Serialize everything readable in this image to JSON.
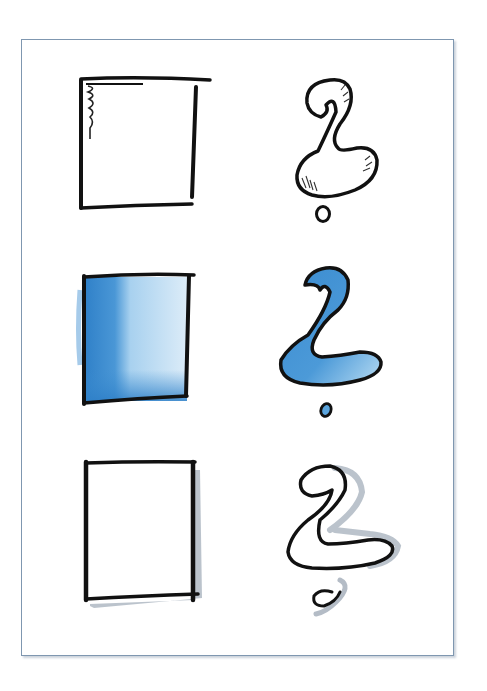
{
  "illustration": {
    "frame": {
      "border_color": "#7f97b0",
      "background": "#ffffff"
    },
    "colors": {
      "ink": "#111111",
      "blue_fill": "#3d8ed1",
      "blue_light": "#a9d2ef",
      "shadow_grey": "#b4bcc6"
    },
    "rows": [
      {
        "row": 1,
        "style": "outline with hatching",
        "shapes": [
          "square-icon",
          "question-mark-icon"
        ]
      },
      {
        "row": 2,
        "style": "blue colored fill",
        "shapes": [
          "square-icon",
          "question-mark-icon"
        ]
      },
      {
        "row": 3,
        "style": "outline with grey drop shadow",
        "shapes": [
          "square-icon",
          "question-mark-icon"
        ]
      }
    ]
  }
}
